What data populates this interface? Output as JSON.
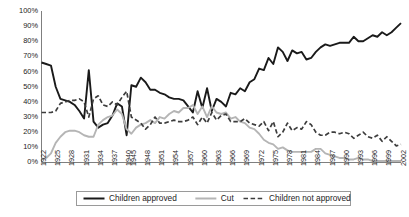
{
  "chart_data": {
    "type": "line",
    "title": "",
    "subtitle": "",
    "xlabel": "",
    "ylabel": "",
    "ylim": [
      0,
      100
    ],
    "ytick_labels": [
      "0%",
      "10%",
      "20%",
      "30%",
      "40%",
      "50%",
      "60%",
      "70%",
      "80%",
      "90%",
      "100%"
    ],
    "ytick_values": [
      0,
      10,
      20,
      30,
      40,
      50,
      60,
      70,
      80,
      90,
      100
    ],
    "grid": false,
    "legend_position": "bottom",
    "x": [
      1922,
      1923,
      1924,
      1925,
      1926,
      1927,
      1928,
      1929,
      1930,
      1931,
      1932,
      1933,
      1934,
      1935,
      1936,
      1937,
      1938,
      1939,
      1940,
      1945,
      1946,
      1947,
      1948,
      1949,
      1950,
      1951,
      1952,
      1953,
      1954,
      1955,
      1956,
      1957,
      1958,
      1959,
      1960,
      1961,
      1962,
      1963,
      1964,
      1965,
      1966,
      1967,
      1968,
      1969,
      1970,
      1971,
      1972,
      1973,
      1974,
      1975,
      1976,
      1977,
      1978,
      1979,
      1980,
      1981,
      1982,
      1983,
      1984,
      1985,
      1986,
      1987,
      1988,
      1989,
      1990,
      1991,
      1992,
      1993,
      1994,
      1995,
      1996,
      1997,
      1998,
      1999,
      2000,
      2001,
      2002
    ],
    "xtick_labels": [
      "1922",
      "1925",
      "1928",
      "1931",
      "1934",
      "1937",
      "1940",
      "1945",
      "1948",
      "1951",
      "1954",
      "1957",
      "1960",
      "1963",
      "1966",
      "1969",
      "1972",
      "1975",
      "1978",
      "1981",
      "1984",
      "1987",
      "1990",
      "1993",
      "1996",
      "1999",
      "2002"
    ],
    "series": [
      {
        "name": "Children approved",
        "style": "solid",
        "color": "#1a1a1a",
        "width": 1.9,
        "values": [
          66,
          65,
          64,
          50,
          42,
          41,
          40,
          38,
          34,
          29,
          61,
          27,
          23,
          25,
          26,
          31,
          39,
          37,
          18,
          51,
          50,
          56,
          53,
          48,
          48,
          46,
          45,
          43,
          42,
          42,
          41,
          37,
          33,
          47,
          36,
          49,
          34,
          42,
          40,
          37,
          46,
          45,
          49,
          47,
          53,
          55,
          62,
          61,
          69,
          65,
          76,
          73,
          67,
          74,
          72,
          73,
          68,
          69,
          73,
          76,
          78,
          77,
          78,
          79,
          79,
          79,
          83,
          80,
          80,
          82,
          84,
          83,
          86,
          84,
          86,
          89,
          92
        ]
      },
      {
        "name": "Cut",
        "style": "solid",
        "color": "#b5b5b5",
        "width": 1.9,
        "values": [
          2,
          3,
          6,
          13,
          17,
          20,
          21,
          21,
          20,
          18,
          17,
          17,
          25,
          28,
          30,
          31,
          35,
          32,
          22,
          19,
          23,
          25,
          26,
          28,
          26,
          30,
          29,
          32,
          34,
          33,
          36,
          36,
          38,
          32,
          37,
          30,
          37,
          33,
          32,
          33,
          29,
          30,
          27,
          26,
          23,
          22,
          19,
          15,
          13,
          12,
          9,
          10,
          8,
          7,
          7,
          7,
          7,
          7,
          9,
          9,
          6,
          5,
          4,
          3,
          3,
          2,
          2,
          3,
          2,
          2,
          1,
          1,
          1,
          1,
          1,
          1,
          1
        ]
      },
      {
        "name": "Children not approved",
        "style": "dashed",
        "color": "#3d3d3d",
        "width": 1.7,
        "values": [
          33,
          33,
          33,
          34,
          39,
          40,
          41,
          41,
          42,
          40,
          30,
          42,
          44,
          38,
          37,
          40,
          38,
          43,
          47,
          30,
          28,
          26,
          22,
          25,
          30,
          26,
          26,
          27,
          28,
          27,
          27,
          28,
          30,
          25,
          30,
          26,
          33,
          28,
          31,
          32,
          27,
          27,
          27,
          29,
          26,
          25,
          24,
          27,
          21,
          27,
          17,
          20,
          26,
          21,
          23,
          22,
          27,
          25,
          20,
          18,
          18,
          20,
          20,
          19,
          20,
          19,
          16,
          18,
          20,
          17,
          16,
          18,
          14,
          17,
          14,
          11,
          12
        ]
      }
    ],
    "legend": [
      {
        "label": "Children approved",
        "style": "solid",
        "color": "#1a1a1a"
      },
      {
        "label": "Cut",
        "style": "solid",
        "color": "#b5b5b5"
      },
      {
        "label": "Children not approved",
        "style": "dashed",
        "color": "#3d3d3d"
      }
    ]
  }
}
